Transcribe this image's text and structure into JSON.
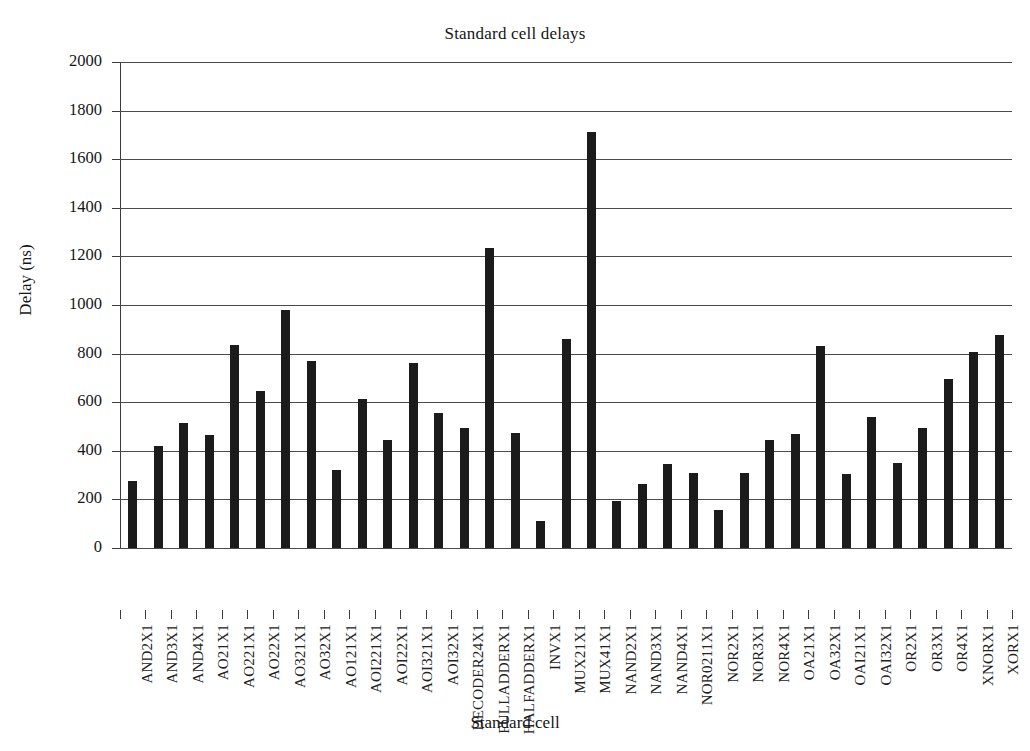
{
  "chart_data": {
    "type": "bar",
    "title": "Standard cell delays",
    "xlabel": "Standard cell",
    "ylabel": "Delay (ns)",
    "ylim": [
      0,
      2000
    ],
    "ytick_step": 200,
    "yticks": [
      0,
      200,
      400,
      600,
      800,
      1000,
      1200,
      1400,
      1600,
      1800,
      2000
    ],
    "grid": "horizontal",
    "legend": "none",
    "bar_color": "#1b1b1b",
    "categories": [
      "AND2X1",
      "AND3X1",
      "AND4X1",
      "AO21X1",
      "AO221X1",
      "AO22X1",
      "AO321X1",
      "AO32X1",
      "AO121X1",
      "AOI221X1",
      "AOI22X1",
      "AOI321X1",
      "AOI32X1",
      "DECODER24X1",
      "FULLADDERX1",
      "HALFADDERX1",
      "INVX1",
      "MUX21X1",
      "MUX41X1",
      "NAND2X1",
      "NAND3X1",
      "NAND4X1",
      "NOR0211X1",
      "NOR2X1",
      "NOR3X1",
      "NOR4X1",
      "OA21X1",
      "OA32X1",
      "OAI21X1",
      "OAI32X1",
      "OR2X1",
      "OR3X1",
      "OR4X1",
      "XNORX1",
      "XORX1"
    ],
    "values": [
      275,
      420,
      515,
      465,
      835,
      645,
      980,
      770,
      320,
      615,
      445,
      760,
      555,
      495,
      1235,
      475,
      110,
      860,
      1710,
      195,
      265,
      345,
      310,
      155,
      310,
      445,
      470,
      830,
      305,
      540,
      350,
      495,
      695,
      805,
      875
    ]
  },
  "ytick_labels": [
    "2000",
    "1800",
    "1600",
    "1400",
    "1200",
    "1000",
    "800",
    "600",
    "400",
    "200",
    "0"
  ]
}
